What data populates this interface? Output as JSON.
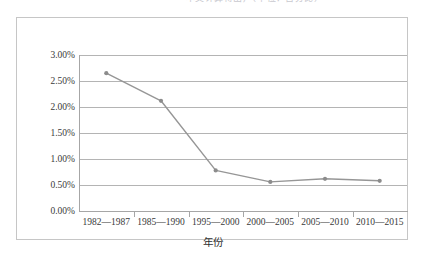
{
  "caption": {
    "text": "本文计算得出，（单位：百分比）"
  },
  "axis": {
    "x_title": "年份",
    "y_ticks": [
      "0.00%",
      "0.50%",
      "1.00%",
      "1.50%",
      "2.00%",
      "2.50%",
      "3.00%"
    ]
  },
  "colors": {
    "line": "#969696",
    "marker": "#8c8c8c",
    "gridline": "#b4b4b4",
    "axis": "#a6a6a6",
    "frame": "#c6c6c6",
    "text": "#3a3a3a"
  },
  "chart_data": {
    "type": "line",
    "title": "",
    "xlabel": "年份",
    "ylabel": "",
    "categories": [
      "1982—1987",
      "1985—1990",
      "1995—2000",
      "2000—2005",
      "2005—2010",
      "2010—2015"
    ],
    "values": [
      2.65,
      2.12,
      0.78,
      0.56,
      0.62,
      0.58
    ],
    "value_unit": "%",
    "ylim": [
      0.0,
      3.0
    ],
    "ytick_values": [
      0.0,
      0.5,
      1.0,
      1.5,
      2.0,
      2.5,
      3.0
    ],
    "ytick_labels": [
      "0.00%",
      "0.50%",
      "1.00%",
      "1.50%",
      "2.00%",
      "2.50%",
      "3.00%"
    ],
    "grid": true,
    "legend": false,
    "markers": true
  }
}
